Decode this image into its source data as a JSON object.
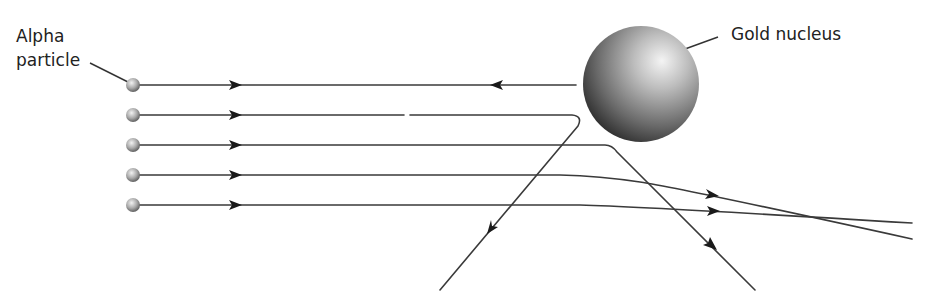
{
  "diagram": {
    "labels": {
      "alpha_line1": "Alpha",
      "alpha_line2": "particle",
      "nucleus": "Gold nucleus"
    },
    "nucleus": {
      "cx": 641,
      "cy": 84,
      "r": 58
    },
    "particles": [
      {
        "id": 1,
        "y": 85,
        "behavior": "reflected back"
      },
      {
        "id": 2,
        "y": 115,
        "behavior": "deflected back-left at large angle"
      },
      {
        "id": 3,
        "y": 145,
        "behavior": "deflected down-right at large angle"
      },
      {
        "id": 4,
        "y": 175,
        "behavior": "deflected slightly"
      },
      {
        "id": 5,
        "y": 205,
        "behavior": "deflected very slightly"
      }
    ],
    "colors": {
      "line": "#3a3a3a",
      "arrow": "#1a1a1a",
      "nucleus_light": "#f2f2f2",
      "nucleus_dark": "#2a2a2a",
      "background": "#ffffff"
    }
  }
}
